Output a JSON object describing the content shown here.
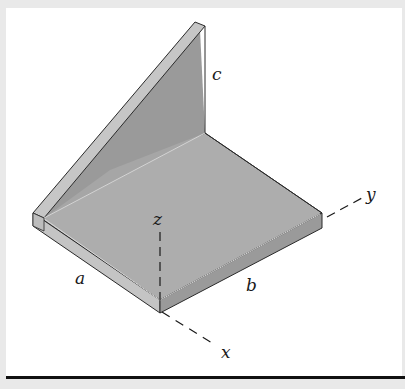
{
  "figure": {
    "labels": {
      "c": "c",
      "z": "z",
      "a": "a",
      "b": "b",
      "y": "y",
      "x": "x"
    },
    "axes": [
      "x",
      "y",
      "z"
    ],
    "dimensions": [
      "a",
      "b",
      "c"
    ]
  },
  "colors": {
    "background": "#ffffff",
    "frame": "#e8e8e8",
    "plate_top": "#b0b0b0",
    "web_face": "#9c9c9c",
    "edge_light": "#c8c8c8",
    "edge_dark": "#8c8c8c",
    "outline": "#2a2a2a",
    "rule": "#111111"
  }
}
